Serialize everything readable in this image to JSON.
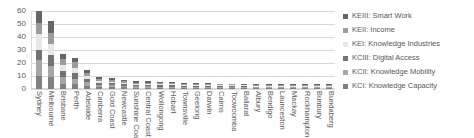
{
  "chart_data": {
    "type": "bar",
    "barmode": "stacked",
    "title": "",
    "xlabel": "",
    "ylabel": "",
    "ylim": [
      0,
      60
    ],
    "yticks": [
      0,
      10,
      20,
      30,
      40,
      50,
      60
    ],
    "grid": true,
    "legend_position": "right",
    "categories": [
      "Sydney",
      "Melbourne",
      "Brisbane",
      "Perth",
      "Adelaide",
      "Canberra",
      "Gold Coast",
      "Newcastle",
      "Sunshine Coast",
      "Central Coast",
      "Wollongong",
      "Hobart",
      "Townsville",
      "Geelong",
      "Darwin",
      "Cairns",
      "Toowoomba",
      "Ballarat",
      "Albury",
      "Bendigo",
      "Launceston",
      "Mackay",
      "Rockhampton",
      "Bunbury",
      "Bundaberg"
    ],
    "series": [
      {
        "name": "KCI: Knowledge Capacity",
        "color": "#808080",
        "values": [
          10.0,
          9.0,
          4.0,
          3.5,
          2.5,
          1.6,
          1.4,
          1.2,
          1.0,
          1.0,
          0.9,
          0.9,
          0.8,
          0.8,
          0.8,
          0.7,
          0.7,
          0.7,
          0.6,
          0.6,
          0.6,
          0.6,
          0.5,
          0.5,
          0.5
        ]
      },
      {
        "name": "KCII: Knowledge Mobility",
        "color": "#a6a6a6",
        "values": [
          12.0,
          9.0,
          5.0,
          4.5,
          3.0,
          1.8,
          1.5,
          1.3,
          1.1,
          1.1,
          1.0,
          1.0,
          0.9,
          0.9,
          0.8,
          0.8,
          0.8,
          0.7,
          0.7,
          0.7,
          0.6,
          0.6,
          0.6,
          0.6,
          0.5
        ]
      },
      {
        "name": "KCIII: Digital Access",
        "color": "#737373",
        "values": [
          8.0,
          8.0,
          4.5,
          4.0,
          2.5,
          1.6,
          1.4,
          1.2,
          1.0,
          1.0,
          0.9,
          0.9,
          0.8,
          0.8,
          0.8,
          0.7,
          0.7,
          0.7,
          0.6,
          0.6,
          0.6,
          0.5,
          0.5,
          0.5,
          0.5
        ]
      },
      {
        "name": "KEI: Knowledge Industries",
        "color": "#e8e8e8",
        "values": [
          12.0,
          9.0,
          5.0,
          4.5,
          2.0,
          1.5,
          1.3,
          1.1,
          0.9,
          0.9,
          0.8,
          0.8,
          0.7,
          0.7,
          0.7,
          0.6,
          0.6,
          0.6,
          0.5,
          0.5,
          0.5,
          0.5,
          0.4,
          0.4,
          0.4
        ]
      },
      {
        "name": "KEII: Income",
        "color": "#9c9c9c",
        "values": [
          9.0,
          8.5,
          4.5,
          4.0,
          2.5,
          1.6,
          1.4,
          1.2,
          1.0,
          1.0,
          0.9,
          0.9,
          0.8,
          0.8,
          0.8,
          0.7,
          0.7,
          0.7,
          0.6,
          0.6,
          0.6,
          0.5,
          0.5,
          0.5,
          0.5
        ]
      },
      {
        "name": "KEIII: Smart Work",
        "color": "#666666",
        "values": [
          9.0,
          8.5,
          4.0,
          3.5,
          2.0,
          1.4,
          1.2,
          1.0,
          0.9,
          0.9,
          0.8,
          0.8,
          0.7,
          0.7,
          0.7,
          0.6,
          0.6,
          0.6,
          0.5,
          0.5,
          0.5,
          0.5,
          0.4,
          0.4,
          0.4
        ]
      }
    ]
  },
  "legend": {
    "items": [
      {
        "label": "KEIII: Smart Work",
        "color": "#666666"
      },
      {
        "label": "KEII: Income",
        "color": "#9c9c9c"
      },
      {
        "label": "KEI: Knowledge Industries",
        "color": "#e8e8e8"
      },
      {
        "label": "KCIII: Digital Access",
        "color": "#737373"
      },
      {
        "label": "KCII: Knowledge Mobility",
        "color": "#a6a6a6"
      },
      {
        "label": "KCI: Knowledge Capacity",
        "color": "#808080"
      }
    ]
  }
}
